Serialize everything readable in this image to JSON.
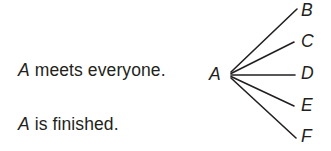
{
  "page": {
    "background_color": "#ffffff",
    "ink_color": "#231f20",
    "width": 331,
    "height": 151
  },
  "sentences": [
    {
      "variable": "A",
      "rest": " meets everyone."
    },
    {
      "variable": "A",
      "rest": " is finished."
    }
  ],
  "diagram": {
    "type": "fan",
    "root": {
      "label": "A",
      "x": 231,
      "y": 75
    },
    "leaves": [
      {
        "label": "B",
        "line_end_x": 297,
        "line_end_y": 9
      },
      {
        "label": "C",
        "line_end_x": 294,
        "line_end_y": 42
      },
      {
        "label": "D",
        "line_end_x": 295,
        "line_end_y": 75
      },
      {
        "label": "E",
        "line_end_x": 294,
        "line_end_y": 106
      },
      {
        "label": "F",
        "line_end_x": 296,
        "line_end_y": 138
      }
    ],
    "line_color": "#231f20",
    "line_width": 1.6
  }
}
